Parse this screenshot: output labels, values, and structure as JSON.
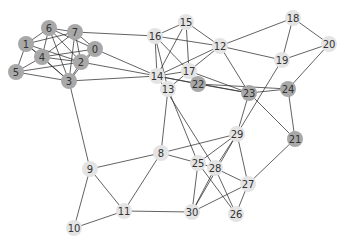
{
  "graph": {
    "colors": {
      "dark_node": "#a8a8a8",
      "light_node": "#e4e4e4",
      "edge": "#333333",
      "label": "#333333"
    },
    "node_radius": 8,
    "nodes": [
      {
        "id": "0",
        "x": 95,
        "y": 49,
        "group": "dark"
      },
      {
        "id": "1",
        "x": 26,
        "y": 44,
        "group": "dark"
      },
      {
        "id": "2",
        "x": 81,
        "y": 62,
        "group": "dark"
      },
      {
        "id": "3",
        "x": 69,
        "y": 81,
        "group": "dark"
      },
      {
        "id": "4",
        "x": 42,
        "y": 57,
        "group": "dark"
      },
      {
        "id": "5",
        "x": 16,
        "y": 72,
        "group": "dark"
      },
      {
        "id": "6",
        "x": 49,
        "y": 28,
        "group": "dark"
      },
      {
        "id": "7",
        "x": 75,
        "y": 32,
        "group": "dark"
      },
      {
        "id": "8",
        "x": 161,
        "y": 153,
        "group": "light"
      },
      {
        "id": "9",
        "x": 90,
        "y": 169,
        "group": "light"
      },
      {
        "id": "10",
        "x": 74,
        "y": 228,
        "group": "light"
      },
      {
        "id": "11",
        "x": 124,
        "y": 211,
        "group": "light"
      },
      {
        "id": "12",
        "x": 220,
        "y": 46,
        "group": "light"
      },
      {
        "id": "13",
        "x": 168,
        "y": 89,
        "group": "light"
      },
      {
        "id": "14",
        "x": 157,
        "y": 76,
        "group": "light"
      },
      {
        "id": "15",
        "x": 186,
        "y": 22,
        "group": "light"
      },
      {
        "id": "16",
        "x": 155,
        "y": 36,
        "group": "light"
      },
      {
        "id": "17",
        "x": 189,
        "y": 71,
        "group": "light"
      },
      {
        "id": "18",
        "x": 293,
        "y": 18,
        "group": "light"
      },
      {
        "id": "19",
        "x": 282,
        "y": 60,
        "group": "light"
      },
      {
        "id": "20",
        "x": 329,
        "y": 44,
        "group": "light"
      },
      {
        "id": "21",
        "x": 295,
        "y": 139,
        "group": "dark"
      },
      {
        "id": "22",
        "x": 198,
        "y": 84,
        "group": "dark"
      },
      {
        "id": "23",
        "x": 249,
        "y": 93,
        "group": "dark"
      },
      {
        "id": "24",
        "x": 288,
        "y": 89,
        "group": "dark"
      },
      {
        "id": "25",
        "x": 198,
        "y": 163,
        "group": "light"
      },
      {
        "id": "26",
        "x": 236,
        "y": 214,
        "group": "light"
      },
      {
        "id": "27",
        "x": 248,
        "y": 184,
        "group": "light"
      },
      {
        "id": "28",
        "x": 215,
        "y": 168,
        "group": "light"
      },
      {
        "id": "29",
        "x": 237,
        "y": 134,
        "group": "light"
      },
      {
        "id": "30",
        "x": 192,
        "y": 212,
        "group": "light"
      }
    ],
    "edges": [
      [
        "1",
        "6"
      ],
      [
        "1",
        "4"
      ],
      [
        "1",
        "5"
      ],
      [
        "1",
        "2"
      ],
      [
        "1",
        "3"
      ],
      [
        "1",
        "7"
      ],
      [
        "6",
        "7"
      ],
      [
        "6",
        "4"
      ],
      [
        "6",
        "0"
      ],
      [
        "6",
        "2"
      ],
      [
        "6",
        "3"
      ],
      [
        "7",
        "4"
      ],
      [
        "7",
        "0"
      ],
      [
        "7",
        "2"
      ],
      [
        "7",
        "3"
      ],
      [
        "7",
        "16"
      ],
      [
        "4",
        "0"
      ],
      [
        "4",
        "2"
      ],
      [
        "4",
        "3"
      ],
      [
        "4",
        "5"
      ],
      [
        "5",
        "2"
      ],
      [
        "5",
        "3"
      ],
      [
        "0",
        "2"
      ],
      [
        "0",
        "3"
      ],
      [
        "0",
        "14"
      ],
      [
        "2",
        "3"
      ],
      [
        "2",
        "14"
      ],
      [
        "3",
        "14"
      ],
      [
        "3",
        "9"
      ],
      [
        "16",
        "15"
      ],
      [
        "16",
        "12"
      ],
      [
        "16",
        "14"
      ],
      [
        "16",
        "13"
      ],
      [
        "16",
        "17"
      ],
      [
        "15",
        "14"
      ],
      [
        "15",
        "17"
      ],
      [
        "15",
        "12"
      ],
      [
        "12",
        "14"
      ],
      [
        "12",
        "17"
      ],
      [
        "12",
        "18"
      ],
      [
        "12",
        "19"
      ],
      [
        "12",
        "23"
      ],
      [
        "18",
        "19"
      ],
      [
        "18",
        "20"
      ],
      [
        "19",
        "20"
      ],
      [
        "20",
        "24"
      ],
      [
        "19",
        "29"
      ],
      [
        "14",
        "17"
      ],
      [
        "14",
        "22"
      ],
      [
        "14",
        "23"
      ],
      [
        "14",
        "28"
      ],
      [
        "13",
        "17"
      ],
      [
        "13",
        "25"
      ],
      [
        "13",
        "8"
      ],
      [
        "17",
        "23"
      ],
      [
        "22",
        "23"
      ],
      [
        "22",
        "24"
      ],
      [
        "23",
        "24"
      ],
      [
        "23",
        "21"
      ],
      [
        "24",
        "21"
      ],
      [
        "23",
        "29"
      ],
      [
        "21",
        "27"
      ],
      [
        "8",
        "29"
      ],
      [
        "8",
        "25"
      ],
      [
        "8",
        "9"
      ],
      [
        "8",
        "11"
      ],
      [
        "9",
        "11"
      ],
      [
        "9",
        "10"
      ],
      [
        "10",
        "11"
      ],
      [
        "11",
        "30"
      ],
      [
        "29",
        "25"
      ],
      [
        "29",
        "28"
      ],
      [
        "29",
        "27"
      ],
      [
        "29",
        "30"
      ],
      [
        "25",
        "28"
      ],
      [
        "25",
        "30"
      ],
      [
        "25",
        "26"
      ],
      [
        "28",
        "27"
      ],
      [
        "28",
        "30"
      ],
      [
        "28",
        "26"
      ],
      [
        "27",
        "26"
      ],
      [
        "27",
        "30"
      ]
    ]
  }
}
